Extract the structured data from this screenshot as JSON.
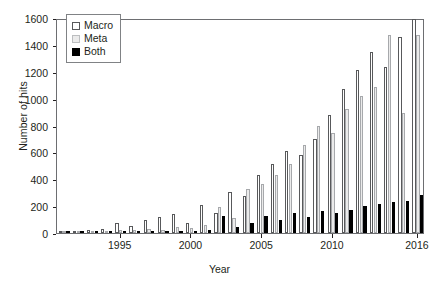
{
  "chart_data": {
    "type": "bar",
    "title": "",
    "xlabel": "Year",
    "ylabel": "Number of hits",
    "ylim": [
      0,
      1600
    ],
    "yticks": [
      0,
      200,
      400,
      600,
      800,
      1000,
      1200,
      1400,
      1600
    ],
    "xticks_labeled": [
      "1995",
      "2000",
      "2005",
      "2010",
      "2016"
    ],
    "grid": false,
    "legend_position": "top-left",
    "categories": [
      "1991",
      "1992",
      "1993",
      "1994",
      "1995",
      "1996",
      "1997",
      "1998",
      "1999",
      "2000",
      "2001",
      "2002",
      "2003",
      "2004",
      "2005",
      "2006",
      "2007",
      "2008",
      "2009",
      "2010",
      "2011",
      "2012",
      "2013",
      "2014",
      "2015",
      "2016"
    ],
    "series": [
      {
        "name": "Macro",
        "values": [
          12,
          18,
          25,
          30,
          78,
          52,
          98,
          118,
          140,
          72,
          205,
          148,
          302,
          278,
          432,
          510,
          612,
          580,
          700,
          880,
          1075,
          1215,
          1350,
          1235,
          1460,
          1590
        ]
      },
      {
        "name": "Meta",
        "values": [
          6,
          10,
          14,
          18,
          22,
          20,
          30,
          26,
          44,
          38,
          60,
          195,
          115,
          330,
          368,
          432,
          510,
          658,
          800,
          742,
          925,
          1020,
          1085,
          1470,
          890,
          1470
        ]
      },
      {
        "name": "Both",
        "values": [
          2,
          3,
          4,
          5,
          8,
          7,
          12,
          10,
          16,
          14,
          22,
          130,
          45,
          78,
          130,
          100,
          148,
          122,
          165,
          152,
          172,
          200,
          215,
          228,
          238,
          280
        ]
      }
    ]
  },
  "legend": {
    "items": [
      {
        "label": "Macro",
        "swatch": "macro-swatch",
        "color": "#ffffff"
      },
      {
        "label": "Meta",
        "swatch": "meta-swatch",
        "color": "#ebebeb"
      },
      {
        "label": "Both",
        "swatch": "both-swatch",
        "color": "#000000"
      }
    ]
  },
  "axes": {
    "y_title": "Number of hits",
    "x_title": "Year"
  },
  "caption": ""
}
